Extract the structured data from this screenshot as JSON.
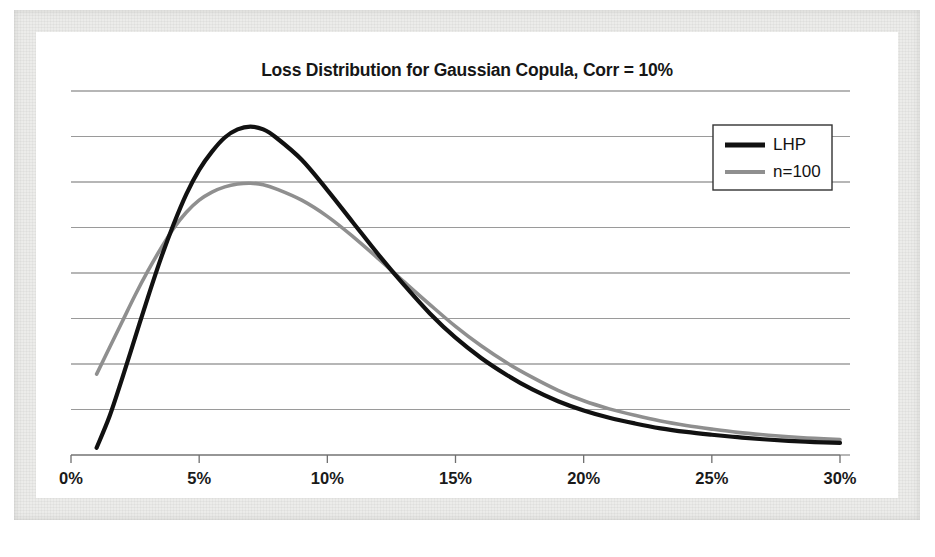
{
  "chart_data": {
    "type": "line",
    "title": "Loss Distribution for Gaussian Copula, Corr = 10%",
    "xlabel": "",
    "ylabel": "",
    "xlim": [
      0,
      30
    ],
    "ylim": [
      0,
      9
    ],
    "grid": true,
    "gridlines_horizontal": 9,
    "y_tick_labels": [],
    "x_tick_labels": [
      "0%",
      "5%",
      "10%",
      "15%",
      "20%",
      "25%",
      "30%"
    ],
    "x_tick_values": [
      0,
      5,
      10,
      15,
      20,
      25,
      30
    ],
    "legend_position": "top-right",
    "x": [
      1,
      1.5,
      2,
      2.5,
      3,
      3.5,
      4,
      4.5,
      5,
      5.5,
      6,
      6.5,
      7,
      7.5,
      8,
      9,
      10,
      11,
      12,
      13,
      14,
      15,
      16,
      17,
      18,
      19,
      20,
      21,
      22,
      23,
      24,
      25,
      26,
      27,
      28,
      29,
      30
    ],
    "series": [
      {
        "name": "LHP",
        "color": "#111111",
        "width": 4.2,
        "values": [
          0.18,
          0.95,
          1.9,
          2.9,
          3.9,
          4.85,
          5.7,
          6.45,
          7.05,
          7.5,
          7.85,
          8.05,
          8.12,
          8.05,
          7.85,
          7.3,
          6.55,
          5.75,
          4.95,
          4.2,
          3.5,
          2.9,
          2.4,
          1.98,
          1.62,
          1.33,
          1.1,
          0.92,
          0.78,
          0.66,
          0.57,
          0.5,
          0.44,
          0.39,
          0.35,
          0.32,
          0.3
        ]
      },
      {
        "name": "n=100",
        "color": "#8f8f8f",
        "width": 3.6,
        "values": [
          2.0,
          2.65,
          3.3,
          3.95,
          4.55,
          5.1,
          5.6,
          6.0,
          6.3,
          6.5,
          6.63,
          6.7,
          6.72,
          6.68,
          6.58,
          6.3,
          5.9,
          5.4,
          4.85,
          4.28,
          3.72,
          3.18,
          2.7,
          2.28,
          1.92,
          1.6,
          1.34,
          1.14,
          0.98,
          0.84,
          0.73,
          0.64,
          0.56,
          0.5,
          0.45,
          0.41,
          0.38
        ]
      }
    ],
    "legend": [
      {
        "label": "LHP",
        "color": "#111111",
        "style": "solid-thick"
      },
      {
        "label": "n=100",
        "color": "#8f8f8f",
        "style": "solid-medium"
      }
    ]
  },
  "caption": ""
}
